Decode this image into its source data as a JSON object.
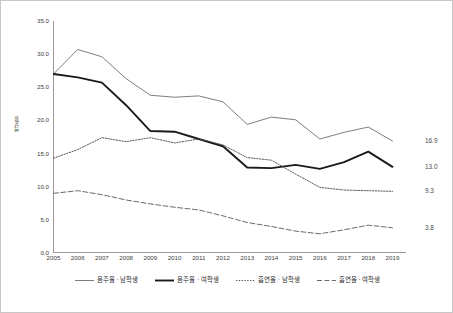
{
  "chart_data": {
    "type": "line",
    "title": "",
    "xlabel": "",
    "ylabel": "백분율",
    "xlim": [
      2005,
      2019
    ],
    "ylim": [
      0.0,
      35.0
    ],
    "grid": false,
    "legend_position": "bottom",
    "categories": [
      "2005",
      "2006",
      "2007",
      "2008",
      "2009",
      "2010",
      "2011",
      "2012",
      "2013",
      "2014",
      "2015",
      "2016",
      "2017",
      "2018",
      "2019"
    ],
    "x": [
      2005,
      2006,
      2007,
      2008,
      2009,
      2010,
      2011,
      2012,
      2013,
      2014,
      2015,
      2016,
      2017,
      2018,
      2019
    ],
    "y_ticks": [
      "0.0",
      "5.0",
      "10.0",
      "15.0",
      "20.0",
      "25.0",
      "30.0",
      "35.0"
    ],
    "y_tick_values": [
      0.0,
      5.0,
      10.0,
      15.0,
      20.0,
      25.0,
      30.0,
      35.0
    ],
    "series": [
      {
        "name": "음주율 · 남학생",
        "style": "solid-thin",
        "color": "#6e6e6e",
        "end_label": "16.9",
        "values": [
          27.0,
          30.7,
          29.6,
          26.3,
          23.8,
          23.5,
          23.7,
          22.8,
          19.4,
          20.5,
          20.1,
          17.2,
          18.2,
          19.0,
          16.9
        ]
      },
      {
        "name": "음주율 · 여학생",
        "style": "solid-thick",
        "color": "#1a1a1a",
        "end_label": "13.0",
        "values": [
          27.0,
          26.5,
          25.7,
          22.3,
          18.4,
          18.3,
          17.2,
          16.1,
          12.9,
          12.8,
          13.3,
          12.7,
          13.7,
          15.3,
          13.0
        ]
      },
      {
        "name": "흡연율 · 남학생",
        "style": "dotted",
        "color": "#4a4a4a",
        "end_label": "9.3",
        "values": [
          14.3,
          15.6,
          17.4,
          16.8,
          17.4,
          16.6,
          17.2,
          16.3,
          14.4,
          14.0,
          11.9,
          9.9,
          9.5,
          9.4,
          9.3
        ]
      },
      {
        "name": "흡연율 · 여학생",
        "style": "dashed",
        "color": "#5a5a5a",
        "end_label": "3.8",
        "values": [
          9.0,
          9.4,
          8.8,
          8.0,
          7.4,
          6.9,
          6.5,
          5.6,
          4.6,
          4.0,
          3.3,
          2.9,
          3.5,
          4.2,
          3.8
        ]
      }
    ],
    "end_value_labels": [
      "16.9",
      "13.0",
      "9.3",
      "3.8"
    ]
  },
  "axis": {
    "y_axis_label": "백분율"
  }
}
